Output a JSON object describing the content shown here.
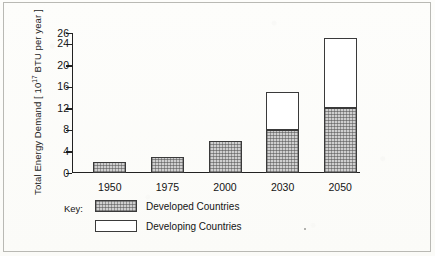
{
  "chart_data": {
    "type": "bar",
    "stacked": true,
    "title": "",
    "subtitle": "",
    "xlabel": "",
    "ylabel": "Total Energy Demand [ 10",
    "ylabel_exponent": "17",
    "ylabel_suffix": " BTU per year ]",
    "categories": [
      "1950",
      "1975",
      "2000",
      "2030",
      "2050"
    ],
    "series": [
      {
        "name": "Developed Countries",
        "values": [
          2,
          3,
          6,
          8,
          12
        ],
        "fill": "hatched-gray",
        "color": "#cfcfcf"
      },
      {
        "name": "Developing Countries",
        "values": [
          0,
          0,
          0,
          7,
          13
        ],
        "fill": "white",
        "color": "#ffffff"
      }
    ],
    "totals": [
      2,
      3,
      6,
      15,
      25
    ],
    "ylim": [
      0,
      26
    ],
    "yticks": [
      0,
      4,
      8,
      12,
      16,
      20,
      24,
      26
    ],
    "ytick_labels": [
      "0",
      "4",
      "8",
      "12",
      "16",
      "20",
      "24",
      "26"
    ],
    "grid": false,
    "legend_position": "below-axis-left",
    "axis_line_color": "#222222",
    "background_color": "#fdfdfb"
  },
  "legend": {
    "title": "Key:",
    "entries": [
      {
        "label": "Developed Countries",
        "swatch": "hatched-gray"
      },
      {
        "label": "Developing Countries",
        "swatch": "white"
      }
    ]
  }
}
